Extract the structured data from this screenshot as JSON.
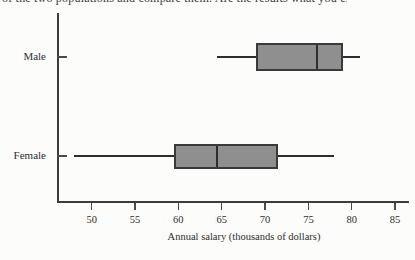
{
  "page": {
    "clipped_caption": "of the two populations and compare them. Are the results what you expected?"
  },
  "chart_data": {
    "type": "boxplot",
    "orientation": "horizontal",
    "title": "",
    "xlabel": "Annual salary (thousands of dollars)",
    "xlim": [
      46,
      86.5
    ],
    "xticks": [
      "50",
      "55",
      "60",
      "65",
      "70",
      "75",
      "80",
      "85"
    ],
    "grid": false,
    "legend": "none",
    "categories": [
      "Male",
      "Female"
    ],
    "series": [
      {
        "name": "Male",
        "min": 64.5,
        "q1": 69,
        "median": 76,
        "q3": 79,
        "max": 81
      },
      {
        "name": "Female",
        "min": 48,
        "q1": 59.5,
        "median": 64.5,
        "q3": 71.5,
        "max": 78
      }
    ],
    "colors": {
      "box_fill": "#8f8f8f",
      "box_border": "#3a3a3a",
      "line": "#2e2e2e",
      "text": "#2e2e2e",
      "background": "#fcfcfa"
    }
  }
}
